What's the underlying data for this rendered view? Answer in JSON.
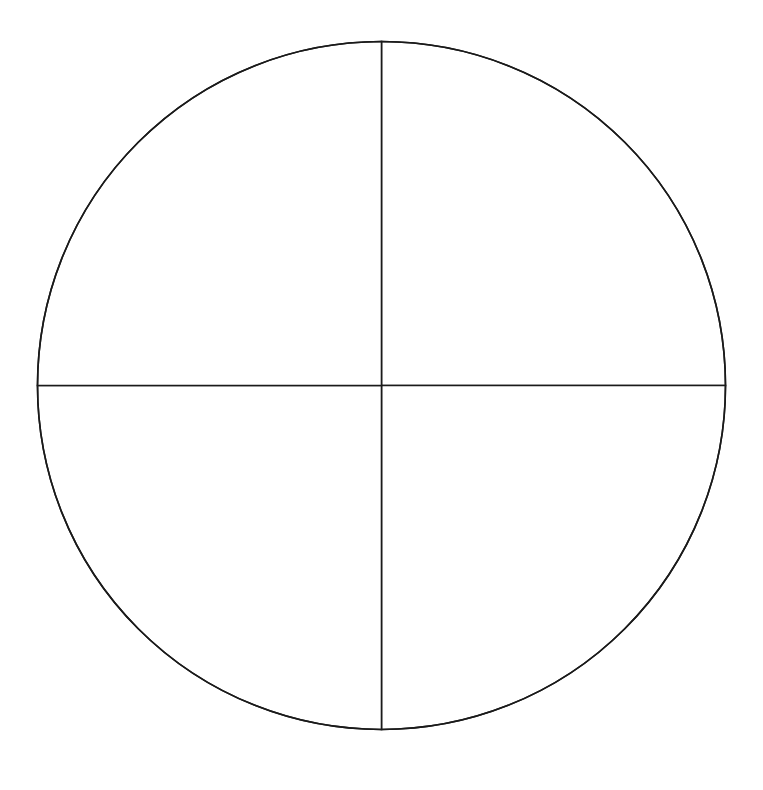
{
  "chart_data": {
    "type": "pie",
    "title": "",
    "categories": [
      "Q1",
      "Q2",
      "Q3",
      "Q4"
    ],
    "values": [
      25,
      25,
      25,
      25
    ],
    "labels_visible": false,
    "legend": "none",
    "colors": {
      "fill": "#ffffff",
      "stroke": "#1a1a1a",
      "background": "#ffffff"
    },
    "geometry": {
      "cx": 381.5,
      "cy": 385.5,
      "r": 344
    }
  }
}
